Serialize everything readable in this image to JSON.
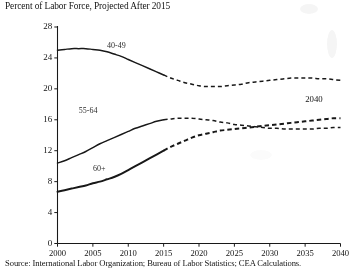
{
  "chart_data": {
    "type": "line",
    "title": "Percent of Labor Force, Projected After 2015",
    "subtitle": "",
    "xlabel": "",
    "ylabel": "",
    "source": "Source: International Labor Organization; Bureau of Labor Statistics; CEA Calculations.",
    "xlim": [
      2000,
      2040
    ],
    "ylim": [
      0,
      28
    ],
    "yticks": [
      0,
      4,
      8,
      12,
      16,
      20,
      24,
      28
    ],
    "ytick_labels": [
      "0",
      "4",
      "8",
      "12",
      "16",
      "20",
      "24",
      "28"
    ],
    "xticks": [
      2000,
      2005,
      2010,
      2015,
      2020,
      2025,
      2030,
      2035,
      2040
    ],
    "xtick_labels": [
      "2000",
      "2005",
      "2010",
      "2015",
      "2020",
      "2025",
      "2030",
      "2035",
      "2040"
    ],
    "grid": false,
    "legend_position": "inline-labels",
    "projection_start_year": 2015,
    "line_color": "#1a1a1a",
    "annotations": [
      {
        "text": "2040",
        "x": 2035.0,
        "y": 18.6
      }
    ],
    "series": [
      {
        "name": "40-49",
        "label": "40-49",
        "label_x": 2007.0,
        "label_y": 25.6,
        "x": [
          2000,
          2001,
          2002,
          2003,
          2004,
          2005,
          2006,
          2007,
          2008,
          2009,
          2010,
          2011,
          2012,
          2013,
          2014,
          2015,
          2016,
          2017,
          2018,
          2019,
          2020,
          2021,
          2022,
          2023,
          2024,
          2025,
          2026,
          2027,
          2028,
          2029,
          2030,
          2031,
          2032,
          2033,
          2034,
          2035,
          2036,
          2037,
          2038,
          2039,
          2040
        ],
        "values": [
          25.0,
          25.1,
          25.2,
          25.2,
          25.2,
          25.1,
          25.0,
          24.8,
          24.5,
          24.2,
          23.8,
          23.4,
          23.0,
          22.6,
          22.2,
          21.8,
          21.4,
          21.1,
          20.8,
          20.6,
          20.4,
          20.3,
          20.3,
          20.3,
          20.4,
          20.5,
          20.6,
          20.8,
          20.9,
          21.0,
          21.1,
          21.2,
          21.3,
          21.4,
          21.4,
          21.4,
          21.4,
          21.3,
          21.3,
          21.2,
          21.1
        ]
      },
      {
        "name": "55-64",
        "label": "55-64",
        "label_x": 2003.0,
        "label_y": 17.2,
        "x": [
          2000,
          2001,
          2002,
          2003,
          2004,
          2005,
          2006,
          2007,
          2008,
          2009,
          2010,
          2011,
          2012,
          2013,
          2014,
          2015,
          2016,
          2017,
          2018,
          2019,
          2020,
          2021,
          2022,
          2023,
          2024,
          2025,
          2026,
          2027,
          2028,
          2029,
          2030,
          2031,
          2032,
          2033,
          2034,
          2035,
          2036,
          2037,
          2038,
          2039,
          2040
        ],
        "values": [
          10.4,
          10.7,
          11.1,
          11.5,
          11.9,
          12.4,
          12.9,
          13.3,
          13.7,
          14.1,
          14.5,
          14.9,
          15.2,
          15.5,
          15.8,
          16.0,
          16.1,
          16.2,
          16.2,
          16.2,
          16.1,
          16.0,
          15.9,
          15.7,
          15.6,
          15.4,
          15.3,
          15.2,
          15.1,
          15.0,
          14.9,
          14.9,
          14.8,
          14.8,
          14.8,
          14.8,
          14.8,
          14.9,
          14.9,
          15.0,
          15.0
        ]
      },
      {
        "name": "60+",
        "label": "60+",
        "label_x": 2005.0,
        "label_y": 9.6,
        "x": [
          2000,
          2001,
          2002,
          2003,
          2004,
          2005,
          2006,
          2007,
          2008,
          2009,
          2010,
          2011,
          2012,
          2013,
          2014,
          2015,
          2016,
          2017,
          2018,
          2019,
          2020,
          2021,
          2022,
          2023,
          2024,
          2025,
          2026,
          2027,
          2028,
          2029,
          2030,
          2031,
          2032,
          2033,
          2034,
          2035,
          2036,
          2037,
          2038,
          2039,
          2040
        ],
        "values": [
          6.7,
          6.9,
          7.1,
          7.3,
          7.5,
          7.8,
          8.0,
          8.3,
          8.6,
          9.0,
          9.5,
          10.0,
          10.5,
          11.0,
          11.5,
          12.0,
          12.5,
          12.9,
          13.3,
          13.7,
          14.0,
          14.2,
          14.4,
          14.6,
          14.7,
          14.8,
          14.9,
          15.0,
          15.1,
          15.2,
          15.3,
          15.4,
          15.5,
          15.6,
          15.7,
          15.8,
          15.9,
          16.0,
          16.1,
          16.2,
          16.2
        ]
      }
    ]
  }
}
